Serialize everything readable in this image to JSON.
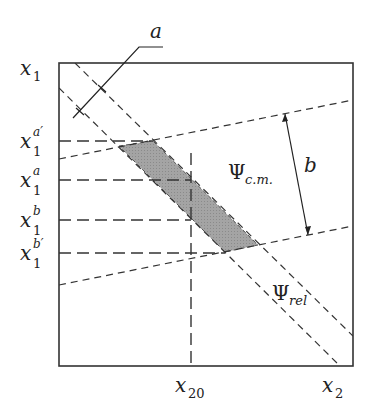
{
  "figure": {
    "type": "phase-space diagram",
    "axes": {
      "vertical": {
        "label": "x",
        "subscript": "1"
      },
      "horizontal": {
        "label": "x",
        "subscript": "2"
      }
    },
    "vertical_ticks": [
      {
        "label": "x",
        "subscript": "1",
        "superscript": "a′",
        "y": 141
      },
      {
        "label": "x",
        "subscript": "1",
        "superscript": "a",
        "y": 180
      },
      {
        "label": "x",
        "subscript": "1",
        "superscript": "b",
        "y": 220
      },
      {
        "label": "x",
        "subscript": "1",
        "superscript": "b′",
        "y": 253
      }
    ],
    "horizontal_ticks": [
      {
        "label": "x",
        "subscript": "20",
        "x": 191
      }
    ],
    "annotations": {
      "width_a": {
        "label": "a"
      },
      "width_b": {
        "label": "b"
      },
      "psi_cm": {
        "symbol": "Ψ",
        "subscript": "c.m."
      },
      "psi_rel": {
        "symbol": "Ψ",
        "subscript": "rel"
      }
    },
    "colors": {
      "line": "#333333",
      "shade": "#9a9a9a",
      "background": "#ffffff"
    }
  }
}
